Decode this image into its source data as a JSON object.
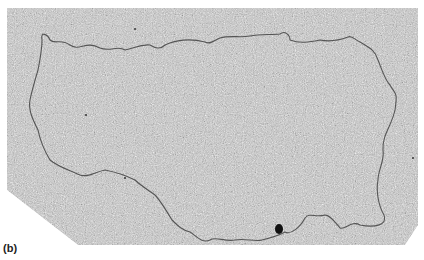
{
  "figure": {
    "panel_label": "(b)",
    "type": "electron micrograph",
    "colors": {
      "background": "#ffffff",
      "micrograph_field": "#bdbdbd",
      "strand": "#555555",
      "particle": "#111111"
    },
    "micrograph_polygon": "7,8 418,8 418,225 405,245 78,245 7,190",
    "strand_path": "M42,40 C40,30 48,35 50,40 C55,45 60,38 70,45 C80,52 85,40 100,48 C110,52 118,45 125,50 C135,48 140,44 150,45 C155,48 160,50 165,45 C175,40 190,38 205,42 C210,45 215,40 220,38 C230,35 240,38 250,36 C260,34 270,35 280,34 C285,30 290,35 290,40 C300,44 310,42 320,40 C330,42 340,40 348,37 C352,35 355,40 360,42 C370,48 375,50 378,60 C382,70 385,80 390,85 C395,95 398,90 395,110 C392,125 382,135 383,150 C385,160 378,170 378,180 C376,190 378,205 384,215 C388,225 375,228 360,225 C352,220 345,230 340,228 C335,222 330,215 325,215 C315,218 310,212 305,218 C300,228 290,235 285,232 C278,236 270,238 262,240 C255,242 245,238 235,240 C225,242 215,236 210,240 C202,244 195,235 190,232 C182,230 178,226 172,220 C166,210 160,200 155,195 C148,190 140,185 135,180 C125,175 115,172 105,170 C95,172 88,178 80,175 C70,170 60,168 50,160 C44,150 40,140 38,130 C33,120 28,110 30,100 C32,90 35,80 38,70 C40,60 42,50 42,40 Z",
    "particle": {
      "cx": 279,
      "cy": 229,
      "rx": 4,
      "ry": 5
    }
  }
}
